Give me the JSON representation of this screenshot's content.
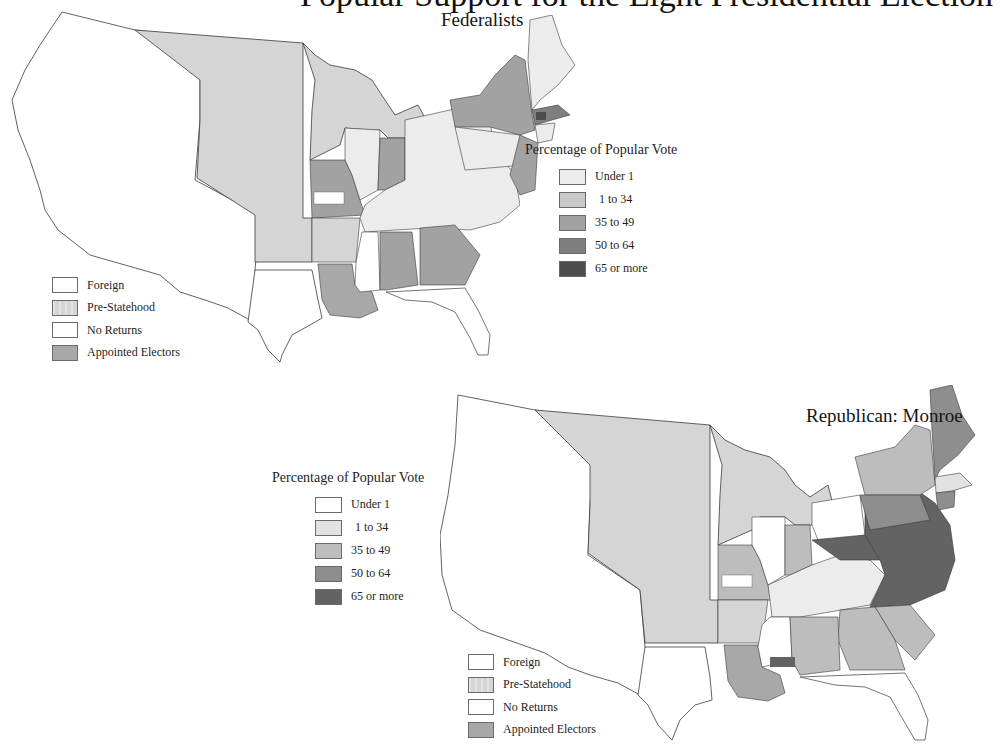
{
  "page": {
    "title_partial": "Popular Support for the Eight Presidential Election"
  },
  "colors": {
    "under_1_fed": "#ececec",
    "1_34_fed": "#c9c9c9",
    "35_49_fed": "#a2a2a2",
    "50_64_fed": "#7f7f7f",
    "65_plus_fed": "#4e4e4e",
    "under_1_rep": "#ffffff",
    "1_34_rep": "#e2e2e2",
    "35_49_rep": "#bdbdbd",
    "50_64_rep": "#8e8e8e",
    "65_plus_rep": "#636363",
    "foreign": "#ffffff",
    "pre_statehood": "#d8d8d8",
    "no_returns": "#ffffff",
    "appointed": "#a8a8a8",
    "outline": "#3a3a3a"
  },
  "maps": {
    "federalists": {
      "title": "Federalists",
      "percentage_legend": {
        "heading": "Percentage of Popular Vote",
        "items": [
          {
            "label": "Under 1"
          },
          {
            "label": "1 to 34"
          },
          {
            "label": "35 to 49"
          },
          {
            "label": "50 to 64"
          },
          {
            "label": "65 or more"
          }
        ]
      },
      "category_legend": {
        "items": [
          {
            "label": "Foreign"
          },
          {
            "label": "Pre-Statehood"
          },
          {
            "label": "No Returns"
          },
          {
            "label": "Appointed Electors"
          }
        ]
      }
    },
    "republican": {
      "title": "Republican: Monroe",
      "percentage_legend": {
        "heading": "Percentage of Popular Vote",
        "items": [
          {
            "label": "Under 1"
          },
          {
            "label": "1 to 34"
          },
          {
            "label": "35 to 49"
          },
          {
            "label": "50 to 64"
          },
          {
            "label": "65 or more"
          }
        ]
      },
      "category_legend": {
        "items": [
          {
            "label": "Foreign"
          },
          {
            "label": "Pre-Statehood"
          },
          {
            "label": "No Returns"
          },
          {
            "label": "Appointed Electors"
          }
        ]
      }
    }
  }
}
